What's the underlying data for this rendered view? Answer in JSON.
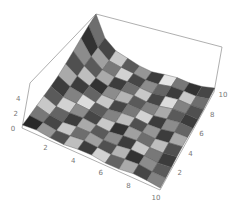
{
  "chart_data": {
    "type": "surface3d",
    "title": "",
    "grid": false,
    "x": {
      "range": [
        0,
        10
      ],
      "ticks": [
        2,
        4,
        6,
        8,
        10
      ],
      "label": ""
    },
    "y": {
      "range": [
        0,
        10
      ],
      "ticks": [
        2,
        4,
        6,
        8,
        10
      ],
      "label": ""
    },
    "z": {
      "range": [
        0,
        6
      ],
      "ticks": [
        0,
        2,
        4
      ],
      "label": ""
    },
    "surface": "z ≈ 6·exp(-x/1.6)·(y/10)^1.4 + 0.4 (peak at back-left corner x=0,y=10)",
    "cell_grays": [
      [
        40,
        120,
        200,
        90,
        60,
        170,
        80,
        140,
        50,
        110
      ],
      [
        150,
        70,
        100,
        210,
        130,
        60,
        190,
        90,
        160,
        70
      ],
      [
        80,
        200,
        60,
        140,
        220,
        100,
        50,
        170,
        120,
        200
      ],
      [
        190,
        110,
        170,
        70,
        90,
        200,
        140,
        60,
        210,
        90
      ],
      [
        60,
        160,
        90,
        200,
        130,
        70,
        180,
        110,
        70,
        150
      ],
      [
        210,
        80,
        140,
        50,
        190,
        120,
        90,
        200,
        140,
        60
      ],
      [
        100,
        180,
        60,
        160,
        80,
        210,
        130,
        70,
        100,
        230
      ],
      [
        170,
        50,
        200,
        110,
        150,
        60,
        170,
        220,
        60,
        120
      ],
      [
        70,
        140,
        120,
        190,
        60,
        140,
        90,
        130,
        200,
        50
      ],
      [
        130,
        90,
        60,
        80,
        170,
        100,
        60,
        80,
        110,
        70
      ]
    ]
  },
  "axes": {
    "z_tick_labels": [
      "0",
      "2",
      "4"
    ],
    "x_tick_labels": [
      "2",
      "4",
      "6",
      "8",
      "10"
    ],
    "y_tick_labels": [
      "2",
      "4",
      "6",
      "8",
      "10"
    ]
  },
  "colors": {
    "box": "#9a9a9a",
    "tick_text": "#777777",
    "mesh": "#555555"
  }
}
